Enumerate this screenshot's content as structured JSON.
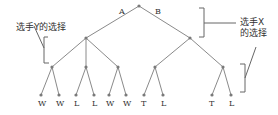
{
  "diagram": {
    "type": "game-tree",
    "root_edges": {
      "left": "A",
      "right": "B"
    },
    "annotations": {
      "player_y": "选手Y的选择",
      "player_x_line1": "选手X",
      "player_x_line2": "的选择"
    },
    "leaves": [
      "W",
      "W",
      "L",
      "L",
      "W",
      "W",
      "T",
      "L",
      "T",
      "L"
    ]
  }
}
